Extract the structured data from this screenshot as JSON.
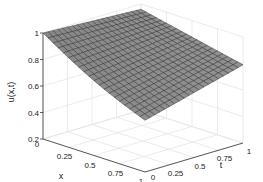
{
  "chart_data": {
    "type": "surface",
    "title": "",
    "xlabel": "x",
    "ylabel": "t",
    "zlabel": "u(x,t)",
    "x_ticks": [
      "0",
      "0.25",
      "0.5",
      "0.75",
      "1"
    ],
    "t_ticks": [
      "0",
      "0.25",
      "0.5",
      "0.75",
      "1"
    ],
    "z_ticks": [
      "0.2",
      "0.4",
      "0.6",
      "0.8",
      "1"
    ],
    "xlim": [
      0,
      1
    ],
    "tlim": [
      0,
      1
    ],
    "zlim": [
      0.2,
      1
    ],
    "grid": true,
    "colormap": "gray",
    "mesh_resolution": 21,
    "corner_values": {
      "u(0,0)": 1.0,
      "u(0,1)": 0.96,
      "u(1,0)": 0.59,
      "u(1,1)": 0.79
    }
  },
  "colors": {
    "surface_face": "#8c8c8c",
    "surface_edge": "#2a2a2a",
    "grid": "#e6e6e6",
    "axis": "#333333"
  }
}
